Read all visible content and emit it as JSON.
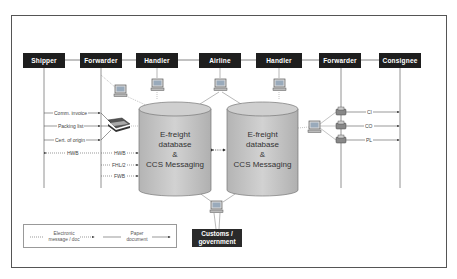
{
  "diagram": {
    "actors": [
      {
        "id": "shipper",
        "label": "Shipper"
      },
      {
        "id": "forwarder-origin",
        "label": "Forwarder"
      },
      {
        "id": "handler-origin",
        "label": "Handler"
      },
      {
        "id": "airline",
        "label": "Airline"
      },
      {
        "id": "handler-dest",
        "label": "Handler"
      },
      {
        "id": "forwarder-dest",
        "label": "Forwarder"
      },
      {
        "id": "consignee",
        "label": "Consignee"
      }
    ],
    "databases": [
      {
        "line1": "E-freight",
        "line2": "database",
        "line3": "&",
        "line4": "CCS Messaging"
      },
      {
        "line1": "E-freight",
        "line2": "database",
        "line3": "&",
        "line4": "CCS Messaging"
      }
    ],
    "customs": {
      "line1": "Customs /",
      "line2": "government"
    },
    "origin_paper_docs": [
      "Comm. invoice",
      "Packing list",
      "Cert. of origin"
    ],
    "origin_electronic_msgs": {
      "shipper_to_forwarder": "HWB",
      "forwarder_to_db": [
        "HWB",
        "FHL/2",
        "FWB"
      ]
    },
    "destination_paper_docs": [
      "CI",
      "CO",
      "PL"
    ],
    "legend": {
      "electronic_line1": "Electronic",
      "electronic_line2": "message / doc",
      "paper_line1": "Paper",
      "paper_line2": "document"
    },
    "colors": {
      "bar_bg": "#1e1e1e",
      "bar_text": "#ffffff",
      "cylinder_fill": "#c8c8c8",
      "line": "#666666"
    }
  }
}
